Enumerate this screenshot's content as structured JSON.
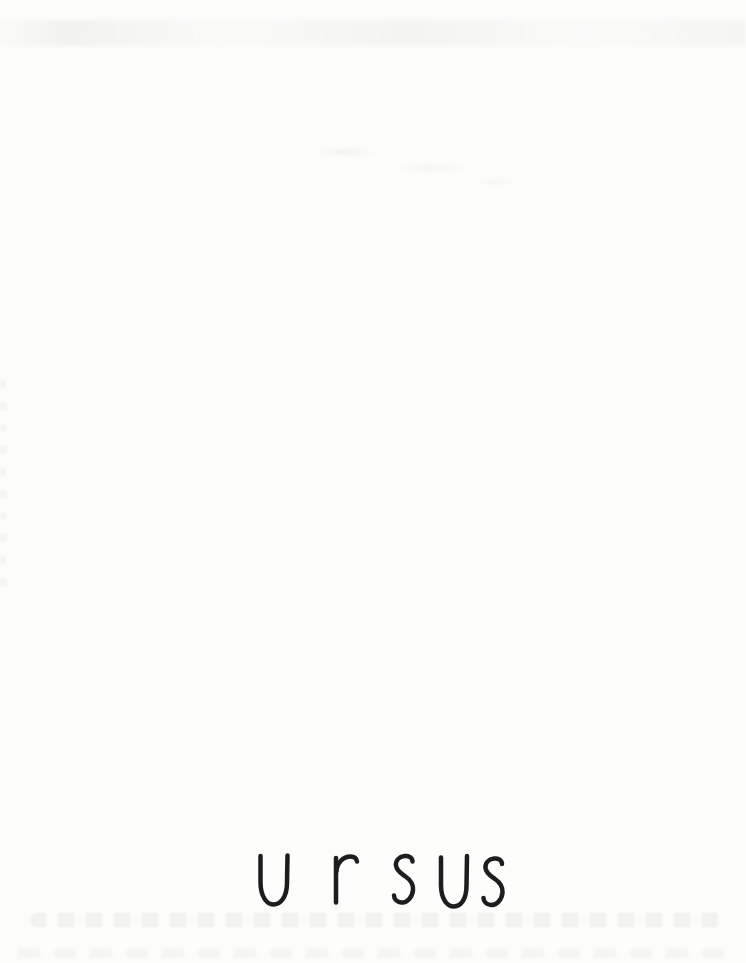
{
  "page": {
    "title": "u r sus"
  },
  "colors": {
    "paper": "#fdfdfc",
    "ink": "#1d1d1d",
    "smudge": "#e6e6e2"
  }
}
